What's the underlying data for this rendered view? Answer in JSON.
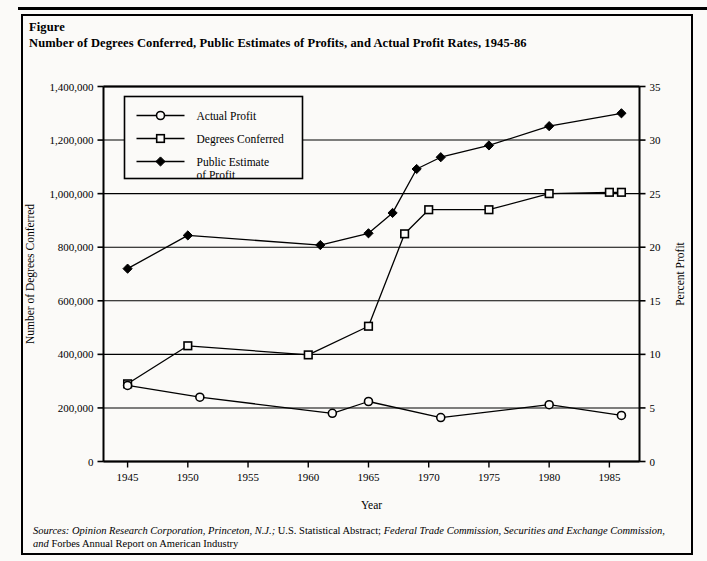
{
  "figure": {
    "label": "Figure",
    "title": "Number of Degrees Conferred, Public Estimates of Profits, and Actual Profit Rates, 1945-86"
  },
  "sources": {
    "prefix": "Sources:",
    "part1_italic": " Opinion Research Corporation, Princeton, N.J.;",
    "part2_roman": " U.S. Statistical Abstract;",
    "part3_italic": " Federal Trade Commission, Securities and Exchange Commission,",
    "part4_italic_and": " and",
    "part5_roman": " Forbes Annual Report on American Industry"
  },
  "legend": {
    "items": [
      {
        "label": "Actual Profit",
        "marker": "open-circle",
        "color": "#000000"
      },
      {
        "label": "Degrees Conferred",
        "marker": "open-square",
        "color": "#000000"
      },
      {
        "label": "Public Estimate of Profit",
        "label_line1": "Public Estimate",
        "label_line2": "of Profit",
        "marker": "filled-diamond",
        "color": "#000000"
      }
    ]
  },
  "chart_data": {
    "type": "line",
    "title": "Number of Degrees Conferred, Public Estimates of Profits, and Actual Profit Rates, 1945-86",
    "xlabel": "Year",
    "ylabel": "Number of Degrees Conferred",
    "y2label": "Percent Profit",
    "xlim": [
      1943,
      1987.5
    ],
    "ylim": [
      0,
      1400000
    ],
    "y2lim": [
      0,
      35
    ],
    "xticks": [
      1945,
      1950,
      1955,
      1960,
      1965,
      1970,
      1975,
      1980,
      1985
    ],
    "xticklabels": [
      "1945",
      "1950",
      "1955",
      "1960",
      "1965",
      "1970",
      "1975",
      "1980",
      "1985"
    ],
    "yticks": [
      0,
      200000,
      400000,
      600000,
      800000,
      1000000,
      1200000,
      1400000
    ],
    "yticklabels": [
      "0",
      "200,000",
      "400,000",
      "600,000",
      "800,000",
      "1,000,000",
      "1,200,000",
      "1,400,000"
    ],
    "y2ticks": [
      0,
      5,
      10,
      15,
      20,
      25,
      30,
      35
    ],
    "y2ticklabels": [
      "0",
      "5",
      "10",
      "15",
      "20",
      "25",
      "30",
      "35"
    ],
    "grid": true,
    "grid_axis": "y",
    "legend_position": "upper-left-inside",
    "series": [
      {
        "name": "Degrees Conferred",
        "axis": "left",
        "marker": "open-square",
        "x": [
          1945,
          1950,
          1960,
          1965,
          1968,
          1970,
          1975,
          1980,
          1985,
          1986
        ],
        "values": [
          290000,
          432000,
          398000,
          505000,
          850000,
          940000,
          940000,
          1000000,
          1005000,
          1005000
        ]
      },
      {
        "name": "Actual Profit",
        "axis": "right",
        "marker": "open-circle",
        "x": [
          1945,
          1951,
          1962,
          1965,
          1971,
          1980,
          1986
        ],
        "values": [
          7.1,
          6.0,
          4.5,
          5.6,
          4.1,
          5.3,
          4.3
        ]
      },
      {
        "name": "Public Estimate of Profit",
        "axis": "right",
        "marker": "filled-diamond",
        "x": [
          1945,
          1950,
          1961,
          1965,
          1967,
          1969,
          1971,
          1975,
          1980,
          1986
        ],
        "values": [
          18.0,
          21.1,
          20.2,
          21.3,
          23.2,
          27.3,
          28.4,
          29.5,
          31.3,
          32.5
        ]
      }
    ]
  },
  "axes": {
    "x_title": "Year",
    "y_left_title": "Number of Degrees Conferred",
    "y_right_title": "Percent Profit"
  }
}
